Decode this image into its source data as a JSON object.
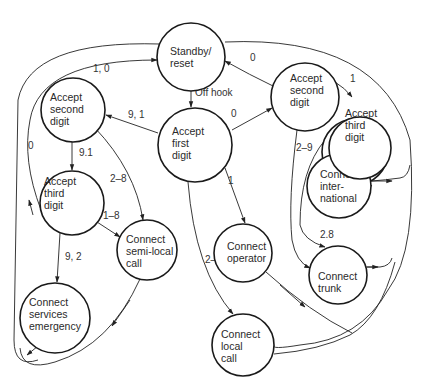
{
  "diagram": {
    "type": "state-transition",
    "nodes": {
      "standby": {
        "lines": [
          "Standby/",
          "reset"
        ]
      },
      "first": {
        "lines": [
          "Accept",
          "first",
          "digit"
        ]
      },
      "second_left": {
        "lines": [
          "Accept",
          "second",
          "digit"
        ]
      },
      "third_left": {
        "lines": [
          "Accept",
          "third",
          "digit"
        ]
      },
      "second_right": {
        "lines": [
          "Accept",
          "second",
          "digit"
        ]
      },
      "third_right": {
        "lines": [
          "Accept",
          "third",
          "digit"
        ]
      },
      "international": {
        "lines": [
          "Connect",
          "inter-",
          "national"
        ]
      },
      "semilocal": {
        "lines": [
          "Connect",
          "semi-local",
          "call"
        ]
      },
      "operator": {
        "lines": [
          "Connect",
          "operator"
        ]
      },
      "trunk": {
        "lines": [
          "Connect",
          "trunk"
        ]
      },
      "emergency": {
        "lines": [
          "Connect",
          "services",
          "emergency"
        ]
      },
      "local": {
        "lines": [
          "Connect",
          "local",
          "call"
        ]
      }
    },
    "edges": {
      "standby_first": "Off hook",
      "first_second_left": "9, 1",
      "first_second_right": "0",
      "first_operator": "1",
      "first_local": "2–8",
      "second_left_third_left": "9.1",
      "second_left_semilocal": "2–8",
      "third_left_semilocal": "1–8",
      "third_left_emergency": "9, 2",
      "third_left_standby": "0",
      "second_left_standby": "1, 0",
      "second_right_standby": "0",
      "second_right_third_right": "1",
      "second_right_trunk": "2–9",
      "third_right_international": "0",
      "third_right_trunk": "2.8"
    }
  }
}
